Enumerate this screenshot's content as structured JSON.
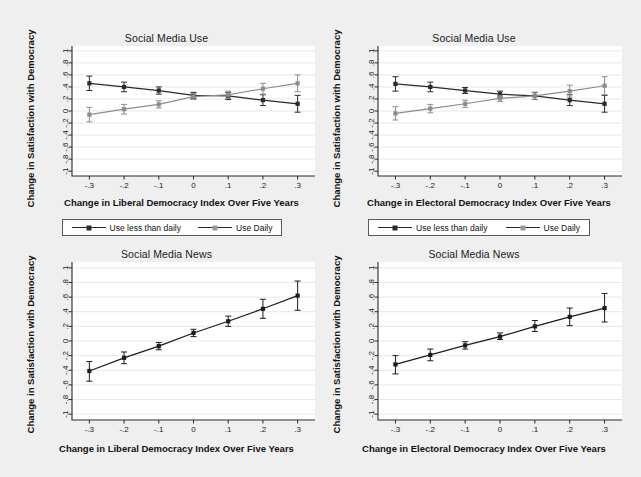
{
  "figure": {
    "background_color": "#efefef",
    "plot_background_color": "#ffffff",
    "grid_color": "#e8e8e8",
    "axis_color": "#2a2a2a",
    "series_colors": {
      "use_less_than_daily": "#2a2a2a",
      "use_daily": "#8c8c8c",
      "single": "#1c1c1c"
    }
  },
  "shared": {
    "ylabel": "Change in Satisfaction with Democracy",
    "yticks": [
      "-1",
      "-.8",
      "-.6",
      "-.4",
      "-.2",
      "0",
      ".2",
      ".4",
      ".6",
      ".8",
      "1"
    ],
    "ytick_values": [
      -1,
      -0.8,
      -0.6,
      -0.4,
      -0.2,
      0,
      0.2,
      0.4,
      0.6,
      0.8,
      1
    ],
    "xticks": [
      "-.3",
      "-.2",
      "-.1",
      "0",
      ".1",
      ".2",
      ".3"
    ],
    "xtick_values": [
      -0.3,
      -0.2,
      -0.1,
      0,
      0.1,
      0.2,
      0.3
    ],
    "xlabel_liberal": "Change in Liberal Democracy Index Over Five Years",
    "xlabel_electoral": "Change in Electoral Democracy Index Over Five Years",
    "title_use": "Social Media Use",
    "title_news": "Social Media News",
    "legend": {
      "item1": "Use less than daily",
      "item2": "Use Daily"
    }
  },
  "chart_data": [
    {
      "id": "top-left",
      "type": "line",
      "title": "Social Media Use",
      "xlabel": "Change in Liberal Democracy Index Over Five Years",
      "ylabel": "Change in Satisfaction with Democracy",
      "x": [
        -0.3,
        -0.2,
        -0.1,
        0,
        0.1,
        0.2,
        0.3
      ],
      "xlim": [
        -0.35,
        0.35
      ],
      "ylim": [
        -1.08,
        1.08
      ],
      "grid": true,
      "legend_position": "below",
      "series": [
        {
          "name": "Use less than daily",
          "color": "#2a2a2a",
          "values": [
            0.46,
            0.4,
            0.34,
            0.26,
            0.25,
            0.18,
            0.12
          ],
          "err_low": [
            0.34,
            0.32,
            0.28,
            0.21,
            0.19,
            0.09,
            -0.02
          ],
          "err_high": [
            0.58,
            0.48,
            0.4,
            0.31,
            0.31,
            0.27,
            0.26
          ]
        },
        {
          "name": "Use Daily",
          "color": "#8c8c8c",
          "values": [
            -0.06,
            0.03,
            0.11,
            0.24,
            0.27,
            0.37,
            0.46
          ],
          "err_low": [
            -0.18,
            -0.05,
            0.05,
            0.19,
            0.21,
            0.28,
            0.32
          ],
          "err_high": [
            0.06,
            0.11,
            0.17,
            0.29,
            0.33,
            0.46,
            0.6
          ]
        }
      ]
    },
    {
      "id": "top-right",
      "type": "line",
      "title": "Social Media Use",
      "xlabel": "Change in Electoral Democracy Index Over Five Years",
      "ylabel": "Change in Satisfaction with Democracy",
      "x": [
        -0.3,
        -0.2,
        -0.1,
        0,
        0.1,
        0.2,
        0.3
      ],
      "xlim": [
        -0.35,
        0.35
      ],
      "ylim": [
        -1.08,
        1.08
      ],
      "grid": true,
      "legend_position": "below",
      "series": [
        {
          "name": "Use less than daily",
          "color": "#2a2a2a",
          "values": [
            0.45,
            0.4,
            0.34,
            0.28,
            0.25,
            0.18,
            0.12
          ],
          "err_low": [
            0.33,
            0.32,
            0.29,
            0.23,
            0.19,
            0.09,
            -0.02
          ],
          "err_high": [
            0.57,
            0.48,
            0.39,
            0.33,
            0.31,
            0.27,
            0.26
          ]
        },
        {
          "name": "Use Daily",
          "color": "#8c8c8c",
          "values": [
            -0.04,
            0.04,
            0.12,
            0.21,
            0.25,
            0.33,
            0.42
          ],
          "err_low": [
            -0.15,
            -0.03,
            0.06,
            0.16,
            0.19,
            0.23,
            0.27
          ],
          "err_high": [
            0.07,
            0.11,
            0.18,
            0.26,
            0.31,
            0.43,
            0.57
          ]
        }
      ]
    },
    {
      "id": "bottom-left",
      "type": "line",
      "title": "Social Media News",
      "xlabel": "Change in Liberal Democracy Index Over Five Years",
      "ylabel": "Change in Satisfaction with Democracy",
      "x": [
        -0.3,
        -0.2,
        -0.1,
        0,
        0.1,
        0.2,
        0.3
      ],
      "xlim": [
        -0.35,
        0.35
      ],
      "ylim": [
        -1.08,
        1.08
      ],
      "grid": true,
      "legend_position": "none",
      "series": [
        {
          "name": "Social Media News",
          "color": "#1c1c1c",
          "values": [
            -0.41,
            -0.23,
            -0.07,
            0.11,
            0.27,
            0.44,
            0.62
          ],
          "err_low": [
            -0.55,
            -0.31,
            -0.12,
            0.06,
            0.2,
            0.31,
            0.42
          ],
          "err_high": [
            -0.28,
            -0.15,
            -0.02,
            0.16,
            0.34,
            0.57,
            0.82
          ]
        }
      ]
    },
    {
      "id": "bottom-right",
      "type": "line",
      "title": "Social Media News",
      "xlabel": "Change in Electoral Democracy Index Over Five Years",
      "ylabel": "Change in Satisfaction with Democracy",
      "x": [
        -0.3,
        -0.2,
        -0.1,
        0,
        0.1,
        0.2,
        0.3
      ],
      "xlim": [
        -0.35,
        0.35
      ],
      "ylim": [
        -1.08,
        1.08
      ],
      "grid": true,
      "legend_position": "none",
      "series": [
        {
          "name": "Social Media News",
          "color": "#1c1c1c",
          "values": [
            -0.32,
            -0.19,
            -0.06,
            0.06,
            0.2,
            0.33,
            0.45
          ],
          "err_low": [
            -0.45,
            -0.27,
            -0.11,
            0.02,
            0.13,
            0.21,
            0.26
          ],
          "err_high": [
            -0.2,
            -0.11,
            -0.01,
            0.11,
            0.28,
            0.45,
            0.65
          ]
        }
      ]
    }
  ]
}
